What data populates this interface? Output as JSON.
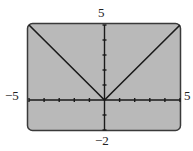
{
  "chart_data": {
    "type": "line",
    "title": "",
    "xlabel": "",
    "ylabel": "",
    "xlim": [
      -5,
      5
    ],
    "ylim": [
      -2,
      5
    ],
    "xticks_step": 1,
    "yticks_step": 1,
    "grid": false,
    "series": [
      {
        "name": "y = |x|",
        "x": [
          -5,
          -4,
          -3,
          -2,
          -1,
          -0.5,
          0,
          0.5,
          1,
          2,
          3,
          4,
          5
        ],
        "y": [
          5,
          4,
          3,
          2,
          1,
          0.5,
          0,
          0.5,
          1,
          2,
          3,
          4,
          5
        ]
      }
    ]
  },
  "labels": {
    "ymax": "5",
    "ymin": "−2",
    "xmin": "−5",
    "xmax": "5"
  },
  "colors": {
    "screen": "#b9b9b9",
    "border": "#3a3a3a",
    "curve": "#1a1a1a"
  }
}
